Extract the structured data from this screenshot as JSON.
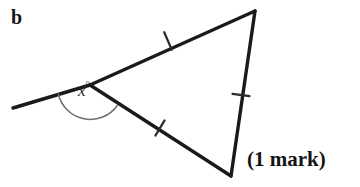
{
  "figure": {
    "part_label": "b",
    "angle_label_value": "x",
    "angle_label_degree": "°",
    "marks_label": "(1 mark)",
    "colors": {
      "ink": "#151515",
      "stroke": "#1a1a1a",
      "arc": "#6f6f6f",
      "tick": "#2b2b2b",
      "background": "#ffffff"
    },
    "geometry": {
      "vertex_left": {
        "x": 90,
        "y": 85
      },
      "vertex_top": {
        "x": 255,
        "y": 11
      },
      "vertex_bottom": {
        "x": 231,
        "y": 176
      },
      "ray_end": {
        "x": 13,
        "y": 108
      },
      "tick_upper_side": {
        "x": 168,
        "y": 41
      },
      "tick_right_side": {
        "x": 241,
        "y": 95
      },
      "tick_lower_side": {
        "x": 160,
        "y": 128
      },
      "arc_radius": 33,
      "stroke_width": 3.4,
      "tick_length": 17
    },
    "description": {
      "shape": "triangle",
      "ticks_per_side": 1,
      "exterior_angle_marked": true
    }
  }
}
